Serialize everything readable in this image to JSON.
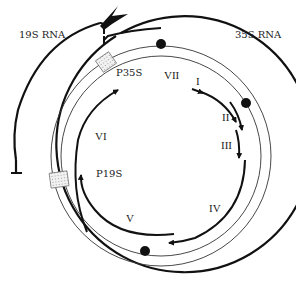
{
  "diagram": {
    "labels": {
      "rna_19s": "19S RNA",
      "rna_35s": "35S RNA",
      "promoter_35s": "P35S",
      "promoter_19s": "P19S"
    },
    "orfs": [
      {
        "id": "VII",
        "label": "VII"
      },
      {
        "id": "I",
        "label": "I"
      },
      {
        "id": "II",
        "label": "II"
      },
      {
        "id": "III",
        "label": "III"
      },
      {
        "id": "IV",
        "label": "IV"
      },
      {
        "id": "V",
        "label": "V"
      },
      {
        "id": "VI",
        "label": "VI"
      }
    ],
    "colors": {
      "line": "#111111",
      "background": "#ffffff",
      "promoter_box": "#dddddd"
    }
  }
}
